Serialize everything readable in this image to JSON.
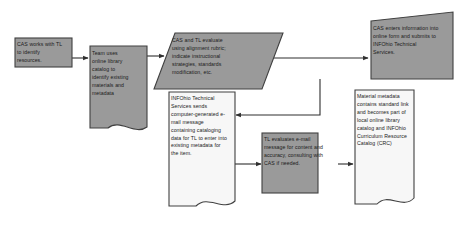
{
  "diagram": {
    "background_color": "#ffffff",
    "fill_gray": "#9a9a9a",
    "fill_white": "#f7f7f7",
    "stroke_color": "#404040",
    "text_color": "#1b1b1b",
    "nodes": [
      {
        "id": "cas-works",
        "name": "cas-works-with-tl",
        "shape": "rectangle",
        "fill": "gray",
        "text": "CAS works with TL to identify resources."
      },
      {
        "id": "team-uses",
        "name": "team-uses-online-library-catalog",
        "shape": "document",
        "fill": "gray",
        "text": "Team uses online library catalog to identify existing materials and metadata"
      },
      {
        "id": "cas-tl-evaluate",
        "name": "cas-and-tl-evaluate",
        "shape": "parallelogram",
        "fill": "gray",
        "text": "CAS and TL evaluate using alignment rubric; indicate instructional strategies, standards modification, etc."
      },
      {
        "id": "cas-enters",
        "name": "cas-enters-information",
        "shape": "parallelogram",
        "fill": "gray",
        "text": "CAS enters information into online form and submits to INFOhio Technical Services."
      },
      {
        "id": "infohio-ts",
        "name": "infohio-technical-services-sends-email",
        "shape": "document",
        "fill": "white",
        "text": "INFOhio Technical Services sends computer-generated e-mail message containing cataloging data for TL to enter into existing metadata for the item."
      },
      {
        "id": "tl-evaluates",
        "name": "tl-evaluates-email",
        "shape": "rectangle",
        "fill": "gray",
        "text": "TL evaluates e-mail message for content and accuracy, consulting with CAS if needed."
      },
      {
        "id": "material-metadata",
        "name": "material-metadata-catalog",
        "shape": "document",
        "fill": "white",
        "text": "Material metadata contains standard link and becomes part of local online library catalog and INFOhio Curriculum Resource Catalog (CRC)"
      }
    ],
    "connectors": [
      {
        "id": "c1",
        "name": "connector-cas-works-to-team-uses",
        "from": "cas-works",
        "to": "team-uses"
      },
      {
        "id": "c2",
        "name": "connector-team-uses-to-cas-tl-evaluate",
        "from": "team-uses",
        "to": "cas-tl-evaluate"
      },
      {
        "id": "c3",
        "name": "connector-cas-tl-evaluate-to-cas-enters",
        "from": "cas-tl-evaluate",
        "to": "cas-enters"
      },
      {
        "id": "c4",
        "name": "connector-cas-enters-to-infohio-ts",
        "from": "cas-enters",
        "to": "infohio-ts"
      },
      {
        "id": "c5",
        "name": "connector-infohio-ts-to-tl-evaluates",
        "from": "infohio-ts",
        "to": "tl-evaluates"
      },
      {
        "id": "c6",
        "name": "connector-tl-evaluates-to-material-metadata",
        "from": "tl-evaluates",
        "to": "material-metadata"
      }
    ]
  }
}
